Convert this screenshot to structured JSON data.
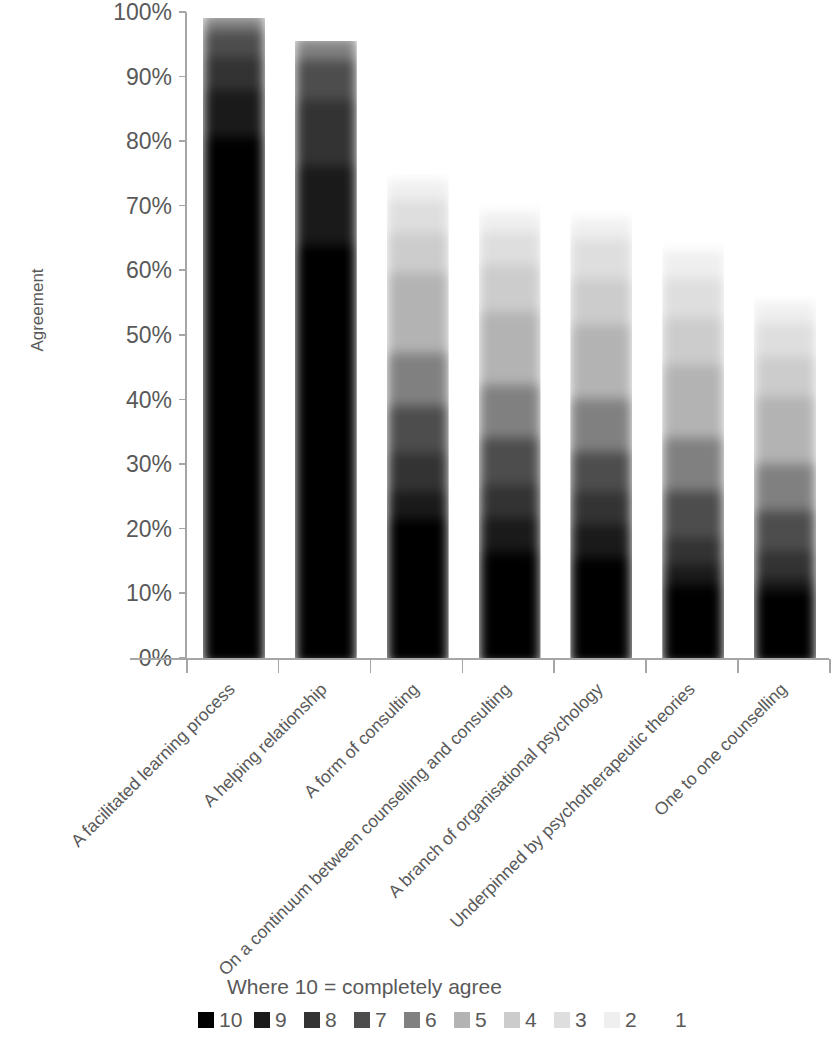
{
  "chart_data": {
    "type": "bar",
    "subtype": "100% stacked bar",
    "title": "",
    "xlabel": "",
    "ylabel": "Agreement",
    "ylim": [
      0,
      100
    ],
    "ytick_labels": [
      "100%",
      "90%",
      "80%",
      "70%",
      "60%",
      "50%",
      "40%",
      "30%",
      "20%",
      "10%",
      "0%"
    ],
    "ytick_values": [
      100,
      90,
      80,
      70,
      60,
      50,
      40,
      30,
      20,
      10,
      0
    ],
    "grid": false,
    "legend_position": "bottom",
    "legend_title": "Where 10 = completely agree",
    "categories": [
      "A facilitated learning process",
      "A helping relationship",
      "A form of consulting",
      "On a continuum between counselling and consulting",
      "A branch of organisational psychology",
      "Underpinned by psychotherapeutic theories",
      "One to one counselling"
    ],
    "series": [
      {
        "name": "10",
        "color": "#000000",
        "values": [
          80,
          63,
          22,
          20,
          16,
          12,
          11
        ]
      },
      {
        "name": "9",
        "color": "#1a1a1a",
        "values": [
          7,
          12,
          4,
          5,
          5,
          3,
          2
        ]
      },
      {
        "name": "8",
        "color": "#333333",
        "values": [
          5,
          10,
          6,
          5,
          5,
          4,
          4
        ]
      },
      {
        "name": "7",
        "color": "#4d4d4d",
        "values": [
          4,
          6,
          7,
          7,
          6,
          7,
          6
        ]
      },
      {
        "name": "6",
        "color": "#808080",
        "values": [
          2,
          3,
          8,
          8,
          8,
          8,
          7
        ]
      },
      {
        "name": "5",
        "color": "#b3b3b3",
        "values": [
          1,
          1,
          12,
          11,
          11,
          11,
          10
        ]
      },
      {
        "name": "4",
        "color": "#cccccc",
        "values": [
          0,
          0,
          6,
          7,
          7,
          7,
          6
        ]
      },
      {
        "name": "3",
        "color": "#dedede",
        "values": [
          0,
          0,
          5,
          5,
          6,
          6,
          5
        ]
      },
      {
        "name": "2",
        "color": "#efefef",
        "values": [
          0,
          0,
          3,
          3,
          3,
          4,
          3
        ]
      },
      {
        "name": "1",
        "color": "#ffffff",
        "values": [
          0,
          0,
          2,
          3,
          4,
          3,
          3
        ]
      }
    ],
    "bar_totals": [
      99,
      95.5,
      75,
      71,
      71,
      65,
      57
    ]
  },
  "legend": {
    "title": "Where 10 = completely agree",
    "items": [
      {
        "label": "10",
        "color": "#000000"
      },
      {
        "label": "9",
        "color": "#1a1a1a"
      },
      {
        "label": "8",
        "color": "#333333"
      },
      {
        "label": "7",
        "color": "#4d4d4d"
      },
      {
        "label": "6",
        "color": "#808080"
      },
      {
        "label": "5",
        "color": "#b3b3b3"
      },
      {
        "label": "4",
        "color": "#cccccc"
      },
      {
        "label": "3",
        "color": "#dedede"
      },
      {
        "label": "2",
        "color": "#efefef"
      },
      {
        "label": "1",
        "color": "#ffffff"
      }
    ]
  },
  "axes": {
    "y_title": "Agreement"
  }
}
